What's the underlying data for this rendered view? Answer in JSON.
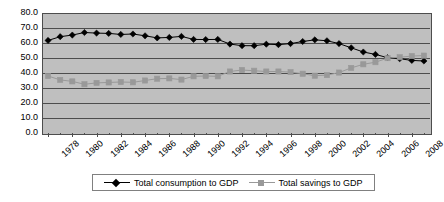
{
  "chart_data": {
    "type": "line",
    "title": "",
    "subtitle": "",
    "xlabel": "",
    "ylabel": "",
    "ylim": [
      0.0,
      80.0
    ],
    "y_ticks": [
      "0.0",
      "10.0",
      "20.0",
      "30.0",
      "40.0",
      "50.0",
      "60.0",
      "70.0",
      "80.0"
    ],
    "y_tick_values": [
      0.0,
      10.0,
      20.0,
      30.0,
      40.0,
      50.0,
      60.0,
      70.0,
      80.0
    ],
    "grid": true,
    "grid_axis": "y",
    "legend_position": "bottom",
    "plot_background": "#bfbfbf",
    "x": [
      1978,
      1979,
      1980,
      1981,
      1982,
      1983,
      1984,
      1985,
      1986,
      1987,
      1988,
      1989,
      1990,
      1991,
      1992,
      1993,
      1994,
      1995,
      1996,
      1997,
      1998,
      1999,
      2000,
      2001,
      2002,
      2003,
      2004,
      2005,
      2006,
      2007,
      2008,
      2009
    ],
    "x_tick_labels": [
      "1978",
      "1980",
      "1982",
      "1984",
      "1986",
      "1988",
      "1990",
      "1992",
      "1994",
      "1996",
      "1998",
      "2000",
      "2002",
      "2004",
      "2006",
      "2008"
    ],
    "x_tick_values": [
      1978,
      1980,
      1982,
      1984,
      1986,
      1988,
      1990,
      1992,
      1994,
      1996,
      1998,
      2000,
      2002,
      2004,
      2006,
      2008
    ],
    "series": [
      {
        "name": "Total consumption to GDP",
        "color": "#000000",
        "marker": "diamond",
        "values": [
          61.7,
          64.2,
          65.3,
          67.0,
          66.6,
          66.4,
          65.7,
          66.0,
          64.8,
          63.4,
          63.7,
          64.4,
          62.4,
          62.3,
          62.4,
          59.3,
          58.2,
          58.2,
          59.2,
          58.9,
          59.6,
          61.0,
          62.1,
          61.5,
          59.6,
          56.8,
          54.0,
          52.4,
          50.2,
          49.5,
          48.4,
          48.0
        ]
      },
      {
        "name": "Total savings to GDP",
        "color": "#999999",
        "marker": "square",
        "values": [
          38.0,
          35.4,
          34.4,
          32.5,
          33.4,
          33.7,
          34.0,
          33.8,
          35.0,
          36.2,
          36.4,
          35.6,
          37.8,
          38.0,
          37.8,
          41.0,
          42.0,
          41.5,
          41.0,
          41.0,
          40.6,
          39.5,
          38.2,
          38.6,
          40.3,
          43.4,
          45.8,
          47.2,
          49.9,
          50.5,
          51.3,
          51.6
        ]
      }
    ]
  },
  "legend": {
    "entries": [
      {
        "label": "Total consumption to GDP"
      },
      {
        "label": "Total savings to GDP"
      }
    ]
  }
}
